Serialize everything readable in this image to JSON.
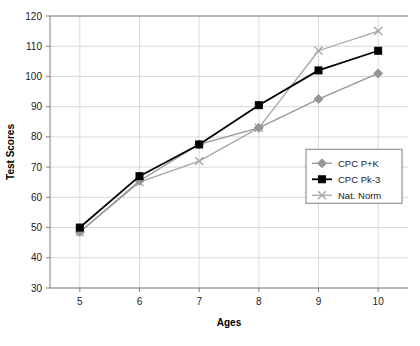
{
  "chart_data": {
    "type": "line",
    "title": "",
    "xlabel": "Ages",
    "ylabel": "Test Scores",
    "categories": [
      "5",
      "6",
      "7",
      "8",
      "9",
      "10"
    ],
    "x": [
      5,
      6,
      7,
      8,
      9,
      10
    ],
    "xlim": [
      4.5,
      10.5
    ],
    "ylim": [
      30,
      120
    ],
    "ytick_labels": [
      "30",
      "40",
      "50",
      "60",
      "70",
      "80",
      "90",
      "100",
      "110",
      "120"
    ],
    "yticks": [
      30,
      40,
      50,
      60,
      70,
      80,
      90,
      100,
      110,
      120
    ],
    "grid": true,
    "legend_position": "right-middle",
    "series": [
      {
        "name": "CPC P+K",
        "values": [
          48.5,
          65.5,
          77.5,
          83,
          92.5,
          101
        ],
        "color": "#969696",
        "marker": "diamond"
      },
      {
        "name": "CPC Pk-3",
        "values": [
          50,
          67,
          77.5,
          90.5,
          102,
          108.5
        ],
        "color": "#000000",
        "marker": "square"
      },
      {
        "name": "Nat. Norm",
        "values": [
          48.5,
          65,
          72,
          83,
          108.5,
          115
        ],
        "color": "#a6a6a6",
        "marker": "x"
      }
    ]
  },
  "legend": {
    "entries": [
      "CPC P+K",
      "CPC Pk-3",
      "Nat. Norm"
    ]
  },
  "axes": {
    "x_title": "Ages",
    "y_title": "Test Scores"
  }
}
